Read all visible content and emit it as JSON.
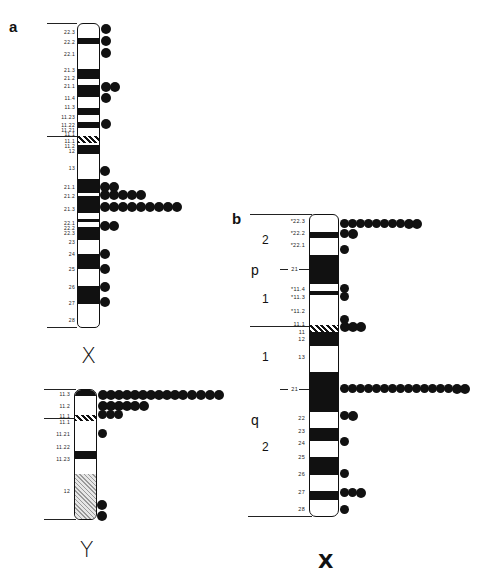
{
  "panels": {
    "a": {
      "letter": "a",
      "chromosome_x": {
        "label": "X",
        "band_labels": [
          "22.3",
          "22.2",
          "22.1",
          "21.3",
          "21.2",
          "21.1",
          "11.4",
          "11.3",
          "11.23",
          "11.22",
          "11.21",
          "11.1",
          "11.1",
          "11.2",
          "12",
          "13",
          "21.1",
          "21.2",
          "21.3",
          "22.1",
          "22.2",
          "22.3",
          "23",
          "24",
          "25",
          "26",
          "27",
          "28"
        ],
        "dot_rows": [
          {
            "band": "22.3",
            "count": 1
          },
          {
            "band": "22.2",
            "count": 1
          },
          {
            "band": "22.1",
            "count": 1
          },
          {
            "band": "21.1",
            "count": 2
          },
          {
            "band": "11.4",
            "count": 1
          },
          {
            "band": "11.22",
            "count": 1
          },
          {
            "band": "13",
            "count": 1
          },
          {
            "band": "21.1",
            "count": 2
          },
          {
            "band": "21.2",
            "count": 5
          },
          {
            "band": "21.3",
            "count": 9
          },
          {
            "band": "22.1",
            "count": 2
          },
          {
            "band": "24",
            "count": 1
          },
          {
            "band": "25",
            "count": 1
          },
          {
            "band": "26",
            "count": 1
          },
          {
            "band": "27",
            "count": 1
          }
        ]
      },
      "chromosome_y": {
        "label": "Y",
        "band_labels": [
          "11.3",
          "11.2",
          "11.1",
          "11.1",
          "11.21",
          "11.22",
          "11.23",
          "12"
        ],
        "dot_rows": [
          {
            "band": "11.3",
            "count": 15
          },
          {
            "band": "11.2",
            "count": 6
          },
          {
            "band": "11.1",
            "count": 3
          },
          {
            "band": "11.21",
            "count": 1
          },
          {
            "band": "12",
            "count": 2
          }
        ]
      }
    },
    "b": {
      "letter": "b",
      "chromosome_x": {
        "label": "X",
        "arm_labels": {
          "p": "p",
          "q": "q"
        },
        "region_labels": {
          "p2": "2",
          "p1": "1",
          "q1": "1",
          "q2": "2"
        },
        "band_labels": [
          "*22.3",
          "*22.2",
          "*22.1",
          "21",
          "*11.4",
          "*11.3",
          "*11.2",
          "11.1",
          "11",
          "12",
          "13",
          "21",
          "22",
          "23",
          "24",
          "25",
          "26",
          "27",
          "28"
        ],
        "dot_rows": [
          {
            "band": "22.3",
            "count": 10
          },
          {
            "band": "22.2",
            "count": 2
          },
          {
            "band": "22.1",
            "count": 1
          },
          {
            "band": "11.4",
            "count": 1
          },
          {
            "band": "11.3",
            "count": 1
          },
          {
            "band": "11.2",
            "count": 1
          },
          {
            "band": "11",
            "count": 3
          },
          {
            "band": "21",
            "count": 16
          },
          {
            "band": "22",
            "count": 2
          },
          {
            "band": "24",
            "count": 1
          },
          {
            "band": "26",
            "count": 1
          },
          {
            "band": "27",
            "count": 3
          },
          {
            "band": "28",
            "count": 1
          }
        ]
      }
    }
  }
}
